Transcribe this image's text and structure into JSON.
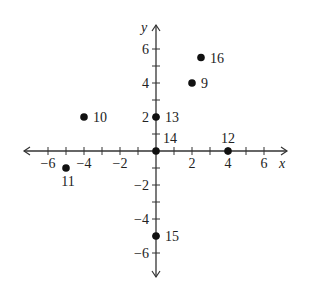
{
  "chart_data": {
    "type": "scatter",
    "title": "",
    "xlabel": "x",
    "ylabel": "y",
    "xlim": [
      -7,
      7
    ],
    "ylim": [
      -7,
      7
    ],
    "grid": false,
    "x_tick_labels": [
      "-6",
      "-4",
      "-2",
      "2",
      "4",
      "6"
    ],
    "y_tick_labels": [
      "6",
      "4",
      "2",
      "-2",
      "-4",
      "-6"
    ],
    "x_ticks": [
      -6,
      -5,
      -4,
      -3,
      -2,
      -1,
      1,
      2,
      3,
      4,
      5,
      6
    ],
    "y_ticks": [
      -6,
      -5,
      -4,
      -3,
      -2,
      -1,
      1,
      2,
      3,
      4,
      5,
      6
    ],
    "points": [
      {
        "label": "9",
        "x": 2,
        "y": 4,
        "label_pos": "right"
      },
      {
        "label": "10",
        "x": -4,
        "y": 2,
        "label_pos": "right"
      },
      {
        "label": "11",
        "x": -5,
        "y": -1,
        "label_pos": "below"
      },
      {
        "label": "12",
        "x": 4,
        "y": 0,
        "label_pos": "above"
      },
      {
        "label": "13",
        "x": 0,
        "y": 2,
        "label_pos": "right"
      },
      {
        "label": "14",
        "x": 0,
        "y": 0,
        "label_pos": "above-right"
      },
      {
        "label": "15",
        "x": 0,
        "y": -5,
        "label_pos": "right"
      },
      {
        "label": "16",
        "x": 2.5,
        "y": 5.5,
        "label_pos": "right"
      }
    ],
    "colors": {
      "axis": "#333333",
      "point": "#111111"
    }
  }
}
